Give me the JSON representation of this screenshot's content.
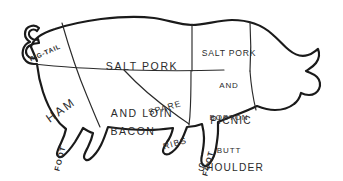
{
  "diagram": {
    "subject": "pig",
    "colors": {
      "background": "#ffffff",
      "outline": "#1a1a1a",
      "cut_line": "#2a2a2a",
      "label_text": "#2b2b2b"
    },
    "labels": {
      "salt_pork_and_loin": {
        "line1": "SALT PORK",
        "line2": "AND LOIN"
      },
      "salt_pork_and_boston_butt": {
        "line1": "SALT PORK",
        "line2": "AND",
        "line3": "BOSTON",
        "line4": "BUTT"
      },
      "ham": "HAM",
      "bacon": "BACON",
      "spare_ribs": {
        "line1": "SPARE",
        "line2": "RIBS"
      },
      "picnic_shoulder": {
        "line1": "PICNIC",
        "line2": "SHOULDER"
      },
      "pig_tail": "PIG-TAIL",
      "foot_rear": "FOOT",
      "foot_front": "FOOT"
    }
  }
}
